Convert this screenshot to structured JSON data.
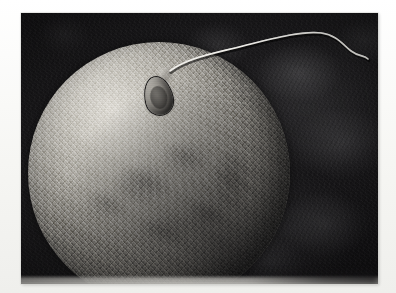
{
  "figure": {
    "kind": "scanning-electron-micrograph",
    "caption": "",
    "border_color": "#f6f6f3",
    "photo": {
      "left": 21,
      "top": 13,
      "width": 357,
      "height": 271,
      "background_color": "#17161a",
      "background_description": "dark mottled electron-micrograph background"
    }
  },
  "subjects": {
    "ovum": {
      "label": "egg cell",
      "shape": "sphere",
      "center_x": 138,
      "center_y": 160,
      "diameter": 262,
      "surface": "granular microvillous texture",
      "highlight_color": "#d7d4cd",
      "shadow_color": "#343230"
    },
    "sperm": {
      "label": "sperm cell",
      "head": {
        "x": 137,
        "y": 83,
        "width": 27,
        "height": 38,
        "rotation_deg": -13
      },
      "tail": {
        "color": "#e8e6df",
        "stroke_width": 1.6,
        "path": "M 149 58 C 168 44, 196 40, 226 32 C 258 24, 282 18, 300 20 C 316 22, 322 32, 330 38 C 338 44, 343 42, 347 46"
      }
    }
  },
  "annotations": []
}
